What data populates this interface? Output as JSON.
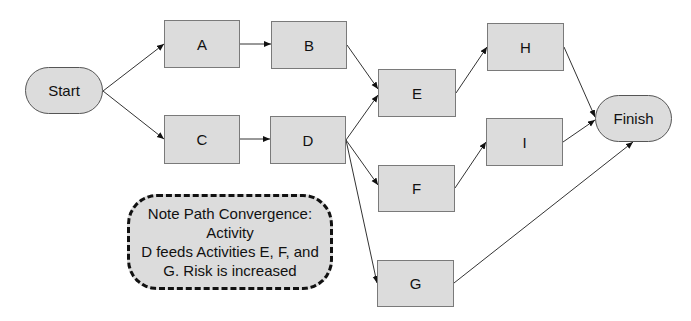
{
  "diagram": {
    "type": "activity-network",
    "nodes": [
      {
        "id": "start",
        "label": "Start",
        "shape": "terminal",
        "x": 25,
        "y": 67,
        "w": 78,
        "h": 47
      },
      {
        "id": "A",
        "label": "A",
        "shape": "box",
        "x": 164,
        "y": 20,
        "w": 76,
        "h": 48
      },
      {
        "id": "B",
        "label": "B",
        "shape": "box",
        "x": 271,
        "y": 21,
        "w": 76,
        "h": 48
      },
      {
        "id": "C",
        "label": "C",
        "shape": "box",
        "x": 164,
        "y": 115,
        "w": 76,
        "h": 49
      },
      {
        "id": "D",
        "label": "D",
        "shape": "box",
        "x": 270,
        "y": 116,
        "w": 76,
        "h": 48
      },
      {
        "id": "E",
        "label": "E",
        "shape": "box",
        "x": 378,
        "y": 69,
        "w": 78,
        "h": 48
      },
      {
        "id": "F",
        "label": "F",
        "shape": "box",
        "x": 378,
        "y": 165,
        "w": 77,
        "h": 47
      },
      {
        "id": "G",
        "label": "G",
        "shape": "box",
        "x": 377,
        "y": 260,
        "w": 77,
        "h": 47
      },
      {
        "id": "H",
        "label": "H",
        "shape": "box",
        "x": 487,
        "y": 23,
        "w": 77,
        "h": 48
      },
      {
        "id": "I",
        "label": "I",
        "shape": "box",
        "x": 486,
        "y": 118,
        "w": 77,
        "h": 48
      },
      {
        "id": "finish",
        "label": "Finish",
        "shape": "terminal",
        "x": 595,
        "y": 95,
        "w": 77,
        "h": 47
      }
    ],
    "edges": [
      {
        "from": "start",
        "to": "A"
      },
      {
        "from": "start",
        "to": "C"
      },
      {
        "from": "A",
        "to": "B"
      },
      {
        "from": "C",
        "to": "D"
      },
      {
        "from": "B",
        "to": "E"
      },
      {
        "from": "D",
        "to": "E"
      },
      {
        "from": "D",
        "to": "F"
      },
      {
        "from": "D",
        "to": "G"
      },
      {
        "from": "E",
        "to": "H"
      },
      {
        "from": "F",
        "to": "I"
      },
      {
        "from": "H",
        "to": "finish"
      },
      {
        "from": "I",
        "to": "finish"
      },
      {
        "from": "G",
        "to": "finish"
      }
    ],
    "note": {
      "lines": [
        "Note Path Convergence:",
        "Activity",
        "D feeds Activities E, F, and",
        "G.  Risk is increased"
      ]
    }
  }
}
